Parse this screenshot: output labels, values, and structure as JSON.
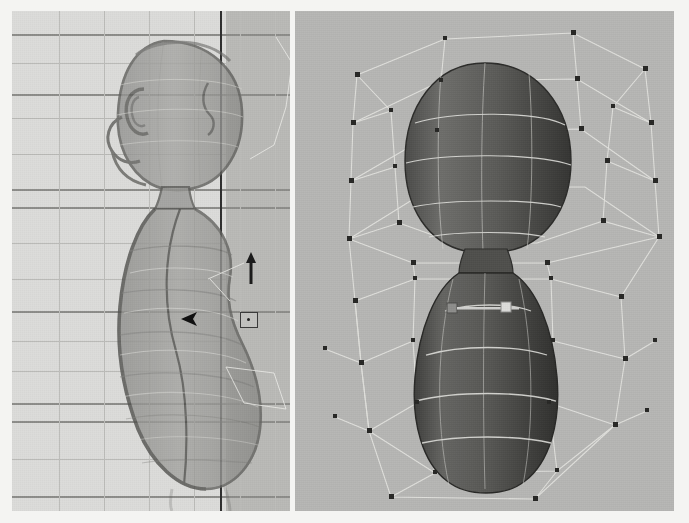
{
  "app": {
    "kind": "3d-modeling-viewport",
    "layout": "two-pane-horizontal-split"
  },
  "canvas": {
    "width": 689,
    "height": 523,
    "background_color": "#f4f4f2"
  },
  "viewports": [
    {
      "id": "left",
      "name": "orthographic-side-view",
      "projection": "orthographic",
      "camera": "side",
      "shading": "x-ray-wireframe-on-shaded",
      "background_color": "#dcdcda",
      "grid_visible": true,
      "grid_color": "#b9b9b6",
      "grid_major_color": "#8d8d8a",
      "axis_line_color": "#2e2e2e",
      "bounds": {
        "x": 12,
        "y": 11,
        "width": 278,
        "height": 500
      }
    },
    {
      "id": "right",
      "name": "perspective-view",
      "projection": "perspective",
      "camera": "persp",
      "shading": "smooth-shaded-with-lattice",
      "background_color": "#b6b6b4",
      "grid_visible": false,
      "lattice_color": "#e8e8e6",
      "lattice_point_color": "#2b2b2b",
      "bounds": {
        "x": 295,
        "y": 11,
        "width": 379,
        "height": 500
      }
    }
  ],
  "model": {
    "name": "character-body-mesh",
    "description": "stylized humanoid head-and-torso blob",
    "surface_color_left": "#9c9c99",
    "surface_color_right_light": "#6a6a68",
    "surface_color_right_dark": "#3d3d3b",
    "wireframe_color_left": "#7a7a77",
    "isoline_color_right": "#e2e2de"
  },
  "deformer": {
    "name": "lattice-ffd",
    "type": "lattice",
    "divisions_s": 4,
    "divisions_t": 6,
    "divisions_u": 4,
    "point_count_visible": 44
  },
  "manipulators": [
    {
      "name": "move-tool-y-axis-arrow",
      "axis": "Y",
      "color": "#1f1f1f",
      "x": 248,
      "y": 255
    },
    {
      "name": "pivot-marker",
      "color": "#3a3a3a",
      "x": 241,
      "y": 313
    },
    {
      "name": "selection-arrow-cursor",
      "color": "#101010",
      "x": 183,
      "y": 315
    },
    {
      "name": "lattice-point-handle",
      "color": "#c9c9c9",
      "x": 452,
      "y": 300
    }
  ],
  "grid_left": {
    "horizontal_lines": [
      {
        "y": 23,
        "weight": "major"
      },
      {
        "y": 52,
        "weight": "minor"
      },
      {
        "y": 83,
        "weight": "major"
      },
      {
        "y": 107,
        "weight": "minor"
      },
      {
        "y": 143,
        "weight": "minor"
      },
      {
        "y": 178,
        "weight": "major"
      },
      {
        "y": 196,
        "weight": "major"
      },
      {
        "y": 232,
        "weight": "minor"
      },
      {
        "y": 268,
        "weight": "minor"
      },
      {
        "y": 300,
        "weight": "major"
      },
      {
        "y": 330,
        "weight": "minor"
      },
      {
        "y": 360,
        "weight": "minor"
      },
      {
        "y": 392,
        "weight": "major"
      },
      {
        "y": 410,
        "weight": "major"
      },
      {
        "y": 448,
        "weight": "minor"
      },
      {
        "y": 485,
        "weight": "major"
      },
      {
        "y": 503,
        "weight": "major"
      }
    ],
    "vertical_lines": [
      {
        "x": 47,
        "weight": "minor"
      },
      {
        "x": 92,
        "weight": "minor"
      },
      {
        "x": 137,
        "weight": "minor"
      },
      {
        "x": 182,
        "weight": "minor"
      },
      {
        "x": 208,
        "weight": "axis"
      },
      {
        "x": 228,
        "weight": "minor"
      },
      {
        "x": 263,
        "weight": "minor"
      },
      {
        "x": 289,
        "weight": "axis"
      }
    ]
  },
  "chart_data": null
}
